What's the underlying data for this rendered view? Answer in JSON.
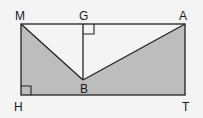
{
  "diagram": {
    "type": "geometry",
    "colors": {
      "shade": "#bdbdbd",
      "line": "#222222",
      "background": "#f4f4f4"
    },
    "points": {
      "M": {
        "label": "M"
      },
      "G": {
        "label": "G"
      },
      "A": {
        "label": "A"
      },
      "B": {
        "label": "B"
      },
      "H": {
        "label": "H"
      },
      "T": {
        "label": "T"
      }
    },
    "right_angles": [
      "G",
      "H"
    ],
    "shaded_region": "rectangle MHTA minus triangle MBA"
  }
}
